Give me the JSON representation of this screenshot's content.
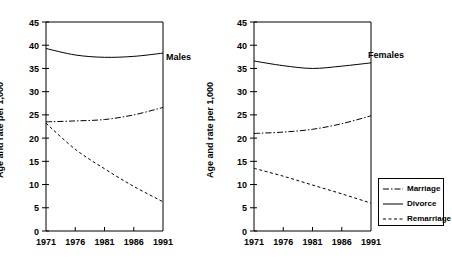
{
  "chart_data": {
    "type": "line",
    "title": "",
    "xlabel": "",
    "ylabel": "Age and rate per 1,000",
    "x": [
      1971,
      1976,
      1981,
      1986,
      1991
    ],
    "xticklabels": [
      "1971",
      "1976",
      "1981",
      "1986",
      "1991"
    ],
    "xlim": [
      1971,
      1991
    ],
    "ylim": [
      0,
      45
    ],
    "yticks": [
      0,
      5,
      10,
      15,
      20,
      25,
      30,
      35,
      40,
      45
    ],
    "yticklabels": [
      "0",
      "5",
      "10",
      "15",
      "20",
      "25",
      "30",
      "35",
      "40",
      "45"
    ],
    "grid": false,
    "legend_position": "bottom-right",
    "panels": [
      {
        "name": "Males",
        "annotation": "Males",
        "series": [
          {
            "name": "Marriage",
            "style": "dash-dot",
            "values": [
              23.5,
              23.7,
              24.0,
              25.0,
              26.6
            ]
          },
          {
            "name": "Divorce",
            "style": "solid",
            "values": [
              39.3,
              37.9,
              37.4,
              37.6,
              38.3
            ]
          },
          {
            "name": "Remarriage",
            "style": "dashed",
            "values": [
              23.2,
              17.6,
              13.4,
              9.6,
              6.3
            ]
          }
        ]
      },
      {
        "name": "Females",
        "annotation": "Females",
        "series": [
          {
            "name": "Marriage",
            "style": "dash-dot",
            "values": [
              21.0,
              21.3,
              21.9,
              23.1,
              24.8
            ]
          },
          {
            "name": "Divorce",
            "style": "solid",
            "values": [
              36.6,
              35.6,
              35.0,
              35.5,
              36.2
            ]
          },
          {
            "name": "Remarriage",
            "style": "dashed",
            "values": [
              13.5,
              11.8,
              9.9,
              8.0,
              6.0
            ]
          }
        ]
      }
    ],
    "legend": [
      {
        "label": "Marriage",
        "style": "dash-dot"
      },
      {
        "label": "Divorce",
        "style": "solid"
      },
      {
        "label": "Remarriage",
        "style": "dashed"
      }
    ],
    "colors": {
      "line": "#000000",
      "axis": "#000000",
      "background": "#ffffff"
    }
  }
}
